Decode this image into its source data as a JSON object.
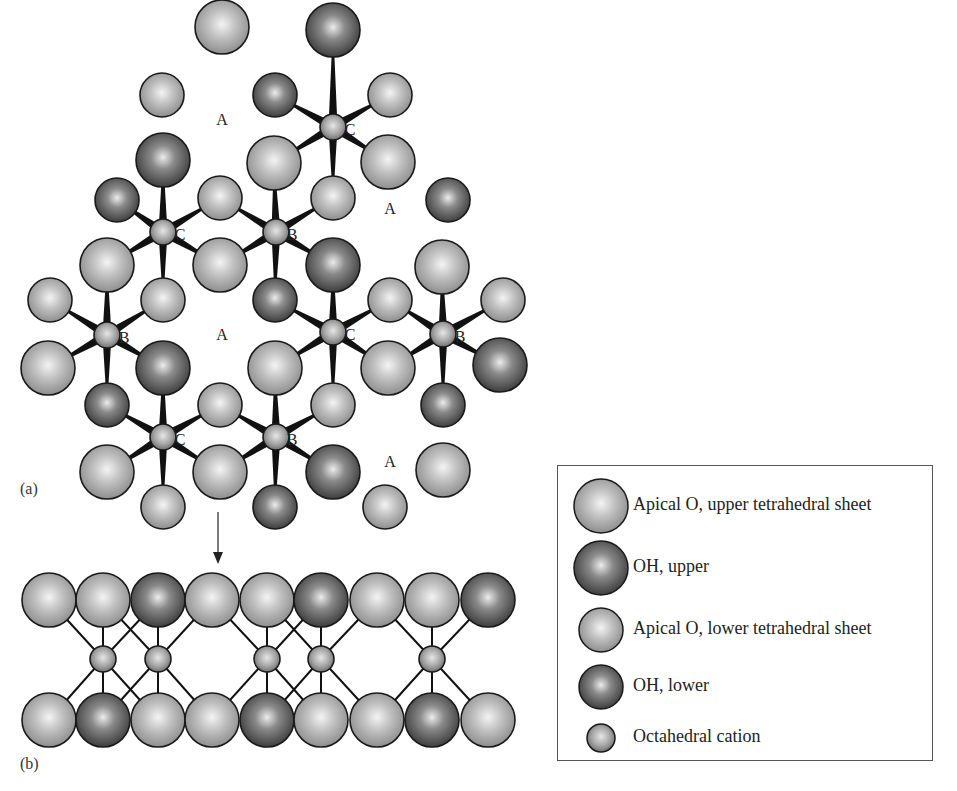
{
  "figure": {
    "top_caption_fragment": "",
    "panel_a_label": "(a)",
    "panel_b_label": "(b)",
    "site_labels": {
      "A": "A",
      "B": "B",
      "C": "C"
    }
  },
  "colors": {
    "light_sphere": "#b4b4b4",
    "dark_sphere": "#6e6e6e",
    "outline": "#1a1a1a",
    "bond": "#111111"
  },
  "legend": {
    "items": [
      {
        "key": "apical-o-upper",
        "label": "Apical O, upper tetrahedral sheet",
        "shade": "light",
        "size": "large"
      },
      {
        "key": "oh-upper",
        "label": "OH, upper",
        "shade": "dark",
        "size": "large"
      },
      {
        "key": "apical-o-lower",
        "label": "Apical O, lower tetrahedral sheet",
        "shade": "light",
        "size": "medium"
      },
      {
        "key": "oh-lower",
        "label": "OH, lower",
        "shade": "dark",
        "size": "medium"
      },
      {
        "key": "octahedral-cation",
        "label": "Octahedral cation",
        "shade": "light",
        "size": "small"
      }
    ]
  },
  "panel_a": {
    "description": "Plan view of dioctahedral sheet showing A (vacant), B and C octahedral sites",
    "site_labels": [
      {
        "text": "A"
      },
      {
        "text": "A"
      },
      {
        "text": "A"
      },
      {
        "text": "A"
      },
      {
        "text": "B"
      },
      {
        "text": "B"
      },
      {
        "text": "B"
      },
      {
        "text": "B"
      },
      {
        "text": "C"
      },
      {
        "text": "C"
      },
      {
        "text": "C"
      },
      {
        "text": "C"
      }
    ]
  },
  "panel_b": {
    "description": "Side view of octahedral sheet",
    "upper_row": [
      "light",
      "light",
      "dark",
      "light",
      "light",
      "dark",
      "light",
      "light",
      "dark"
    ],
    "lower_row": [
      "light",
      "dark",
      "light",
      "light",
      "dark",
      "light",
      "light",
      "dark",
      "light"
    ],
    "cation_positions": [
      1,
      2,
      4,
      5,
      7
    ]
  }
}
